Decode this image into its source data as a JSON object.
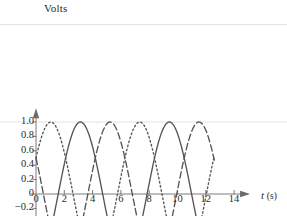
{
  "chart_data": {
    "type": "line",
    "title": "",
    "xlabel": "t (s)",
    "ylabel": "Volts",
    "xlim": [
      -0.4,
      15.2
    ],
    "ylim": [
      -1.08,
      1.12
    ],
    "grid": false,
    "legend": "none",
    "xticks": [
      0,
      2,
      4,
      6,
      8,
      10,
      12,
      14
    ],
    "xtick_labels": [
      "0",
      "2",
      "4",
      "6",
      "8",
      "10",
      "12",
      "14"
    ],
    "yticks": [
      -1.0,
      -0.8,
      -0.6,
      -0.4,
      -0.2,
      0,
      0.2,
      0.4,
      0.6,
      0.8,
      1.0
    ],
    "ytick_labels": [
      "−1.0",
      "−0.8",
      "−0.6",
      "−0.4",
      "−0.2",
      "0",
      "0.2",
      "0.4",
      "0.6",
      "0.8",
      "1.0"
    ],
    "x_domain": [
      0,
      12.6
    ],
    "series": [
      {
        "name": "phase-a-solid",
        "style": "solid",
        "color": "#555555",
        "amplitude": 1.0,
        "period": 6.283,
        "phase_deg": 180,
        "formula": "sin(t - pi/2) shifted: y = -cos(t)",
        "start_value": -1.0,
        "peaks_at": [
          3.14,
          9.42
        ],
        "troughs_at": [
          0.0,
          6.28,
          12.57
        ]
      },
      {
        "name": "phase-b-dashed",
        "style": "dashed",
        "color": "#555555",
        "amplitude": 1.0,
        "period": 6.283,
        "phase_deg": 60,
        "formula": "y = -cos(t + 2pi/3)",
        "start_value": 0.5,
        "peaks_at": [
          1.05,
          7.33
        ],
        "troughs_at": [
          4.19,
          10.47
        ]
      },
      {
        "name": "phase-c-dotted",
        "style": "dotted",
        "color": "#555555",
        "amplitude": 1.0,
        "period": 6.283,
        "phase_deg": 300,
        "formula": "y = -cos(t - 2pi/3)",
        "start_value": 0.5,
        "peaks_at": [
          5.24,
          11.52
        ],
        "troughs_at": [
          2.09,
          8.38
        ]
      }
    ]
  },
  "axes": {
    "y_axis_label": "Volts",
    "x_axis_label_var": "t",
    "x_axis_label_unit": "(s)"
  }
}
